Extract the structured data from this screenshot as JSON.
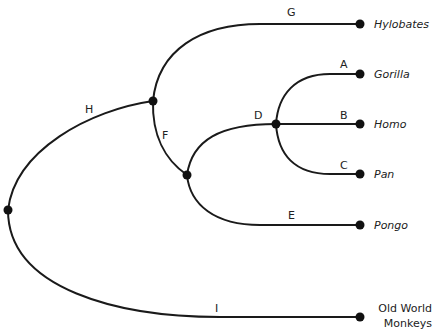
{
  "diagram": {
    "type": "phylogenetic-tree",
    "taxa": [
      {
        "id": "hylobates",
        "label": "Hylobates",
        "italic": true
      },
      {
        "id": "gorilla",
        "label": "Gorilla",
        "italic": true
      },
      {
        "id": "homo",
        "label": "Homo",
        "italic": true
      },
      {
        "id": "pan",
        "label": "Pan",
        "italic": true
      },
      {
        "id": "pongo",
        "label": "Pongo",
        "italic": true
      },
      {
        "id": "owm",
        "label_line1": "Old World",
        "label_line2": "Monkeys",
        "italic": false
      }
    ],
    "branches": {
      "A": "A",
      "B": "B",
      "C": "C",
      "D": "D",
      "E": "E",
      "F": "F",
      "G": "G",
      "H": "H",
      "I": "I"
    },
    "colors": {
      "line": "#1a1a1a",
      "node": "#111111",
      "background": "#ffffff"
    }
  }
}
